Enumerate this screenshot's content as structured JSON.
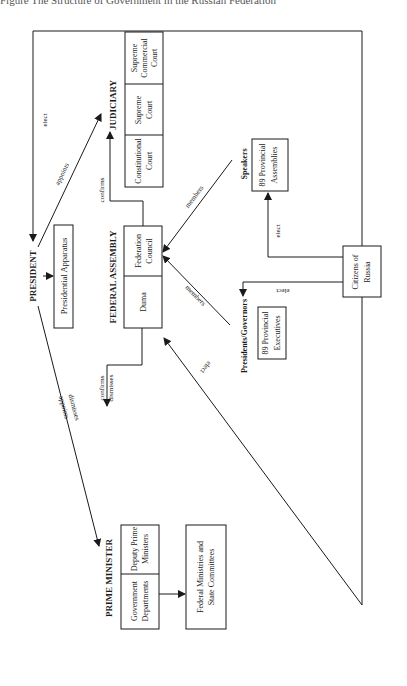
{
  "caption": {
    "left": "Figure  The Structure of Government in the Russian Federation",
    "right": "(after Constitution)"
  },
  "branches": {
    "president": {
      "title": "PRESIDENT",
      "apparatus": "Presidential Apparatus"
    },
    "judiciary": {
      "title": "JUDICIARY",
      "courts": [
        {
          "line1": "Constitutional",
          "line2": "Court"
        },
        {
          "line1": "Supreme",
          "line2": "Court"
        },
        {
          "line1": "Supreme",
          "line2": "Commercial",
          "line3": "Court"
        }
      ]
    },
    "federal_assembly": {
      "title": "FEDERAL ASSEMBLY",
      "chambers": [
        {
          "line1": "Duma"
        },
        {
          "line1": "Federation",
          "line2": "Council"
        }
      ]
    },
    "prime_minister": {
      "title": "PRIME MINISTER",
      "units": [
        {
          "line1": "Government",
          "line2": "Departments"
        },
        {
          "line1": "Deputy Prime",
          "line2": "Ministers"
        }
      ],
      "subordinate": {
        "line1": "Federal Ministries and",
        "line2": "State Committees"
      }
    },
    "speakers": {
      "title": "Speakers",
      "line1": "89 Provincial",
      "line2": "Assemblies"
    },
    "governors": {
      "title": "Presidents/Governors",
      "line1": "89 Provincial",
      "line2": "Executives"
    },
    "citizens": {
      "line1": "Citizens of",
      "line2": "Russia"
    }
  },
  "edges": {
    "citizens_president": "elect",
    "president_judiciary": "appoints",
    "council_judiciary": "confirms",
    "speakers_council": "members",
    "governors_council": "members",
    "citizens_assemblies": "elect",
    "citizens_governors": "elect",
    "citizens_duma": "elect",
    "president_pm_1": "appoints",
    "president_pm_2": "dismisses",
    "duma_pm_1": "confirms",
    "duma_pm_2": "dismisses"
  }
}
